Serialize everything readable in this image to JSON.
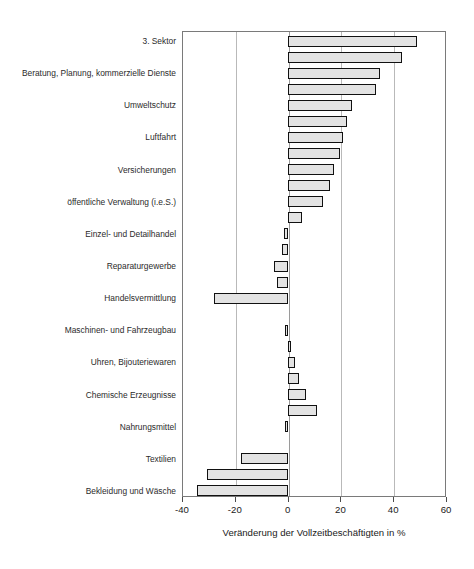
{
  "faint_header": "",
  "chart_data": {
    "type": "bar",
    "orientation": "horizontal",
    "title": "",
    "xlabel": "Veränderung der Vollzeitbeschäftigten in %",
    "ylabel": "",
    "xlim": [
      -40,
      60
    ],
    "xticks": [
      -40,
      -20,
      0,
      20,
      40,
      60
    ],
    "xticklabels": [
      "-40",
      "-20",
      "0",
      "20",
      "40",
      "60"
    ],
    "grid": true,
    "grid_axis": "x",
    "legend": false,
    "bar_facecolor": "#e3e3e3",
    "bar_edgecolor": "#111111",
    "categories": [
      "3. Sektor",
      "Beratung, Planung, kommerzielle Dienste",
      "Umweltschutz",
      "Luftfahrt",
      "Versicherungen",
      "öffentliche Verwaltung (i.e.S.)",
      "Einzel- und Detailhandel",
      "Reparaturgewerbe",
      "Handelsvermittlung",
      "Maschinen- und Fahrzeugbau",
      "Uhren, Bijouteriewaren",
      "Chemische Erzeugnisse",
      "Nahrungsmittel",
      "Textilien",
      "Bekleidung und Wäsche"
    ],
    "bars": [
      {
        "label": "3. Sektor",
        "value": 49.0,
        "row": 0
      },
      {
        "label": "",
        "value": 43.5,
        "row": 1
      },
      {
        "label": "Beratung, Planung, kommerzielle Dienste",
        "value": 35.0,
        "row": 2
      },
      {
        "label": "",
        "value": 33.5,
        "row": 3
      },
      {
        "label": "Umweltschutz",
        "value": 24.5,
        "row": 4
      },
      {
        "label": "",
        "value": 22.5,
        "row": 5
      },
      {
        "label": "Luftfahrt",
        "value": 21.0,
        "row": 6
      },
      {
        "label": "",
        "value": 20.0,
        "row": 7
      },
      {
        "label": "Versicherungen",
        "value": 17.5,
        "row": 8
      },
      {
        "label": "",
        "value": 16.0,
        "row": 9
      },
      {
        "label": "öffentliche Verwaltung (i.e.S.)",
        "value": 13.5,
        "row": 10
      },
      {
        "label": "",
        "value": 5.5,
        "row": 11
      },
      {
        "label": "Einzel- und Detailhandel",
        "value": -1.5,
        "row": 12
      },
      {
        "label": "",
        "value": -2.0,
        "row": 13
      },
      {
        "label": "Reparaturgewerbe",
        "value": -5.0,
        "row": 14
      },
      {
        "label": "",
        "value": -4.0,
        "row": 15
      },
      {
        "label": "Handelsvermittlung",
        "value": -28.0,
        "row": 16
      },
      {
        "label": "Maschinen- und Fahrzeugbau",
        "value": -0.8,
        "row": 18
      },
      {
        "label": "",
        "value": 1.2,
        "row": 19
      },
      {
        "label": "Uhren, Bijouteriewaren",
        "value": 2.8,
        "row": 20
      },
      {
        "label": "",
        "value": 4.5,
        "row": 21
      },
      {
        "label": "Chemische Erzeugnisse",
        "value": 6.8,
        "row": 22
      },
      {
        "label": "",
        "value": 11.0,
        "row": 23
      },
      {
        "label": "Nahrungsmittel",
        "value": -1.0,
        "row": 24
      },
      {
        "label": "Textilien",
        "value": -17.5,
        "row": 26
      },
      {
        "label": "",
        "value": -30.5,
        "row": 27
      },
      {
        "label": "Bekleidung und Wäsche",
        "value": -34.5,
        "row": 28
      }
    ],
    "label_rows": [
      0,
      2,
      4,
      6,
      8,
      10,
      12,
      14,
      16,
      18,
      20,
      22,
      24,
      26,
      28
    ]
  }
}
